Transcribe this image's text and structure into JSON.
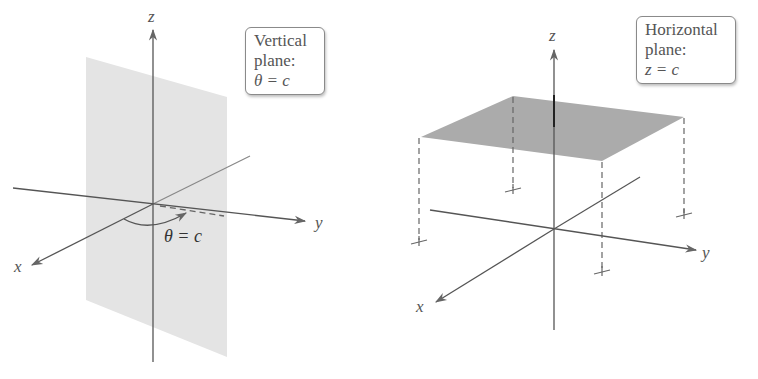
{
  "figures": [
    {
      "id": "vertical-plane",
      "axes": {
        "x": "x",
        "y": "y",
        "z": "z"
      },
      "callout": {
        "line1": "Vertical",
        "line2": "plane:",
        "equation": "θ = c"
      },
      "angle_label": "θ = c",
      "plane_color": "#e2e2e2"
    },
    {
      "id": "horizontal-plane",
      "axes": {
        "x": "x",
        "y": "y",
        "z": "z"
      },
      "callout": {
        "line1": "Horizontal",
        "line2": "plane:",
        "equation": "z = c"
      },
      "plane_color": "#a9a9a9"
    }
  ],
  "colors": {
    "axis": "#555555",
    "dashed": "#666666",
    "box_border": "#8a8a8a"
  }
}
